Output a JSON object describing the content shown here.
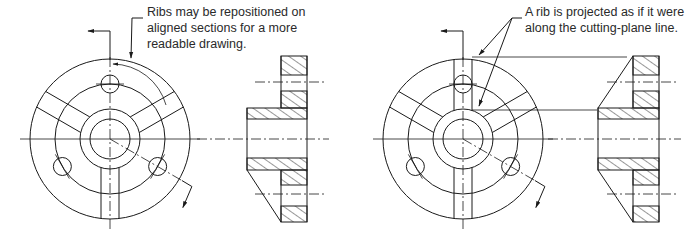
{
  "annotations": {
    "left": {
      "lines": [
        "Ribs may be repositioned on",
        "aligned sections for a more",
        "readable drawing."
      ]
    },
    "right": {
      "lines": [
        "A rib is projected as if it were",
        "along the cutting-plane line."
      ]
    }
  },
  "views": [
    {
      "id": "left",
      "circular_view": {
        "center": [
          110,
          139
        ],
        "outer_radius": 80,
        "bolt_circle_radius": 55,
        "hub_radius": 30,
        "bore_radius": 20,
        "bolt_hole_radius": 9,
        "bolt_hole_angles_deg": [
          90,
          210,
          330
        ],
        "rib_angles_deg": [
          150,
          30,
          270
        ],
        "rib_half_width": 9
      },
      "section_view": {
        "flange_x": [
          281,
          307
        ],
        "hub_left_x": 247,
        "top_y": 56,
        "bottom_y": 222,
        "center_y": 139
      }
    },
    {
      "id": "right",
      "circular_view": {
        "center": [
          463,
          139
        ],
        "outer_radius": 80,
        "bolt_circle_radius": 55,
        "hub_radius": 30,
        "bore_radius": 20,
        "bolt_hole_radius": 9,
        "bolt_hole_angles_deg": [
          90,
          210,
          330
        ],
        "rib_angles_deg": [
          150,
          30,
          270,
          90
        ],
        "rib_half_width": 9
      },
      "section_view": {
        "flange_x": [
          633,
          659
        ],
        "hub_left_x": 598,
        "top_y": 56,
        "bottom_y": 222,
        "center_y": 139
      }
    }
  ],
  "colors": {
    "line": "#1a1a1a",
    "text": "#2a2a2a",
    "background": "#ffffff"
  }
}
